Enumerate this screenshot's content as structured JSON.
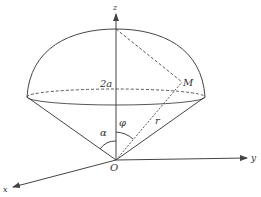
{
  "diagram": {
    "labels": {
      "z_axis": "z",
      "y_axis": "y",
      "x_axis": "x",
      "origin": "O",
      "point": "M",
      "height": "2a",
      "angle_alpha": "α",
      "angle_phi": "φ",
      "radius": "r"
    },
    "colors": {
      "stroke": "#444444",
      "label": "#333333"
    }
  }
}
